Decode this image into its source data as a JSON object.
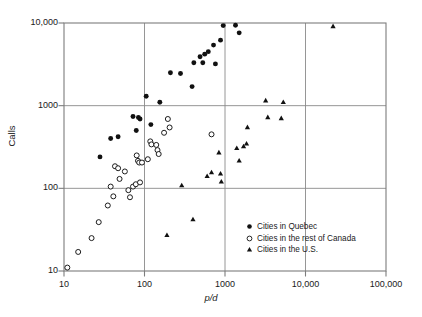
{
  "chart_data": {
    "type": "scatter",
    "title": "",
    "xlabel": "p/d",
    "ylabel": "Calls",
    "xscale": "log",
    "yscale": "log",
    "xlim": [
      10,
      100000
    ],
    "ylim": [
      10,
      10000
    ],
    "xticks": [
      10,
      100,
      1000,
      10000,
      100000
    ],
    "xticklabels": [
      "10",
      "100",
      "1000",
      "10,000",
      "100,000"
    ],
    "yticks": [
      10,
      100,
      1000,
      10000
    ],
    "yticklabels": [
      "10",
      "100",
      "1000",
      "10,000"
    ],
    "grid": "major gridlines at decades inside plot frame",
    "legend_position": "lower right inside axes",
    "series": [
      {
        "name": "Cities in Quebec",
        "marker": "filled-circle",
        "points": [
          [
            28,
            240
          ],
          [
            38,
            400
          ],
          [
            47,
            420
          ],
          [
            72,
            740
          ],
          [
            79,
            500
          ],
          [
            84,
            720
          ],
          [
            88,
            690
          ],
          [
            105,
            1300
          ],
          [
            120,
            590
          ],
          [
            155,
            1100
          ],
          [
            210,
            2500
          ],
          [
            280,
            2450
          ],
          [
            390,
            1700
          ],
          [
            410,
            3300
          ],
          [
            490,
            3900
          ],
          [
            530,
            3300
          ],
          [
            560,
            4200
          ],
          [
            620,
            4500
          ],
          [
            720,
            5400
          ],
          [
            760,
            3200
          ],
          [
            880,
            6200
          ],
          [
            950,
            9300
          ],
          [
            1350,
            9400
          ],
          [
            1500,
            7600
          ]
        ]
      },
      {
        "name": "Cities in the rest of Canada",
        "marker": "open-circle",
        "points": [
          [
            11,
            11
          ],
          [
            15,
            17
          ],
          [
            22,
            25
          ],
          [
            27,
            39
          ],
          [
            35,
            62
          ],
          [
            38,
            105
          ],
          [
            41,
            80
          ],
          [
            43,
            185
          ],
          [
            47,
            175
          ],
          [
            49,
            130
          ],
          [
            57,
            160
          ],
          [
            63,
            95
          ],
          [
            66,
            78
          ],
          [
            72,
            105
          ],
          [
            78,
            112
          ],
          [
            80,
            250
          ],
          [
            83,
            215
          ],
          [
            86,
            205
          ],
          [
            88,
            118
          ],
          [
            93,
            205
          ],
          [
            110,
            225
          ],
          [
            118,
            370
          ],
          [
            122,
            340
          ],
          [
            140,
            335
          ],
          [
            145,
            290
          ],
          [
            150,
            260
          ],
          [
            175,
            470
          ],
          [
            195,
            690
          ],
          [
            205,
            545
          ],
          [
            680,
            450
          ]
        ]
      },
      {
        "name": "Cities in the U.S.",
        "marker": "filled-triangle",
        "points": [
          [
            190,
            27
          ],
          [
            290,
            108
          ],
          [
            400,
            42
          ],
          [
            600,
            140
          ],
          [
            680,
            155
          ],
          [
            840,
            270
          ],
          [
            880,
            150
          ],
          [
            900,
            120
          ],
          [
            1400,
            305
          ],
          [
            1500,
            215
          ],
          [
            1700,
            320
          ],
          [
            1850,
            345
          ],
          [
            1900,
            545
          ],
          [
            3200,
            1150
          ],
          [
            3400,
            720
          ],
          [
            5000,
            700
          ],
          [
            5300,
            1100
          ],
          [
            22000,
            9100
          ]
        ]
      }
    ]
  },
  "legend": {
    "items": [
      {
        "label": "Cities in Quebec",
        "marker": "filled-circle"
      },
      {
        "label": "Cities in the rest of Canada",
        "marker": "open-circle"
      },
      {
        "label": "Cities in the U.S.",
        "marker": "filled-triangle"
      }
    ]
  },
  "colors": {
    "frame": "#7d7d7d",
    "grid": "#8a8a8a",
    "marker": "#111111",
    "text": "#1a1a1a",
    "background": "#ffffff"
  }
}
